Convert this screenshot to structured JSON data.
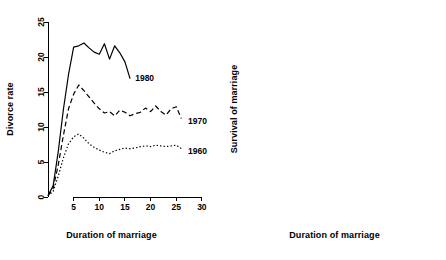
{
  "figure": {
    "panels": [
      {
        "id": "divorce-rate-panel",
        "xlabel": "Duration of marriage",
        "ylabel": "Divorce rate"
      },
      {
        "id": "survival-panel",
        "xlabel": "Duration of marriage",
        "ylabel": "Survival of marriage"
      }
    ]
  },
  "chart_data": [
    {
      "type": "line",
      "title": "",
      "xlabel": "Duration of marriage",
      "ylabel": "Divorce rate",
      "xlim": [
        0,
        31
      ],
      "ylim": [
        0,
        25
      ],
      "xticks": [
        5,
        10,
        15,
        20,
        25,
        30
      ],
      "yticks": [
        0,
        5,
        10,
        15,
        20,
        25
      ],
      "grid": false,
      "legend": "inline-right-of-curves",
      "series": [
        {
          "name": "1980",
          "style": "solid",
          "label_x": 17.0,
          "label_y": 17.0,
          "x": [
            0,
            1,
            2,
            3,
            4,
            5,
            6,
            7,
            8,
            9,
            10,
            11,
            12,
            13,
            14,
            15,
            16
          ],
          "y": [
            0.2,
            1.6,
            6.5,
            12.5,
            17.5,
            21.4,
            21.6,
            22.0,
            21.3,
            20.7,
            20.4,
            21.9,
            19.7,
            21.6,
            20.6,
            19.3,
            16.9
          ]
        },
        {
          "name": "1970",
          "style": "dashed",
          "label_x": 27.3,
          "label_y": 10.9,
          "x": [
            0,
            1,
            2,
            3,
            4,
            5,
            6,
            7,
            8,
            9,
            10,
            11,
            12,
            13,
            14,
            15,
            16,
            17,
            18,
            19,
            20,
            21,
            22,
            23,
            24,
            25,
            26
          ],
          "y": [
            0.2,
            1.2,
            4.6,
            8.8,
            12.6,
            14.7,
            16.0,
            15.2,
            14.3,
            13.4,
            12.6,
            12.0,
            12.2,
            11.6,
            12.4,
            12.1,
            11.6,
            11.9,
            12.1,
            12.7,
            12.2,
            13.0,
            12.2,
            11.7,
            12.6,
            12.9,
            11.2
          ]
        },
        {
          "name": "1960",
          "style": "dotted",
          "label_x": 27.3,
          "label_y": 6.6,
          "x": [
            0,
            1,
            2,
            3,
            4,
            5,
            6,
            7,
            8,
            9,
            10,
            11,
            12,
            13,
            14,
            15,
            16,
            17,
            18,
            19,
            20,
            21,
            22,
            23,
            24,
            25,
            26
          ],
          "y": [
            0.1,
            0.8,
            3.0,
            5.6,
            7.6,
            8.6,
            9.0,
            8.4,
            7.6,
            7.1,
            6.7,
            6.4,
            6.2,
            6.6,
            6.8,
            7.0,
            6.9,
            7.0,
            7.2,
            7.3,
            7.2,
            7.4,
            7.3,
            7.2,
            7.3,
            7.4,
            6.9
          ]
        }
      ]
    },
    {
      "type": "line",
      "title": "",
      "xlabel": "Duration of marriage",
      "ylabel": "Survival of marriage",
      "xlim": [
        0,
        27
      ],
      "ylim": [
        0.5,
        1.0
      ],
      "xticks": [
        5,
        10,
        15,
        20,
        25
      ],
      "yticks": [
        0.5,
        0.6,
        0.7,
        0.8,
        0.9,
        1.0
      ],
      "grid": false,
      "legend": "none",
      "series": [
        {
          "name": "1980",
          "style": "solid",
          "x": [
            0,
            1,
            2,
            3,
            4,
            5,
            6,
            7,
            8,
            9,
            10,
            11,
            12,
            13,
            14,
            15,
            16
          ],
          "y": [
            1.0,
            1.0,
            0.999,
            0.996,
            0.99,
            0.981,
            0.969,
            0.955,
            0.94,
            0.923,
            0.905,
            0.886,
            0.866,
            0.845,
            0.823,
            0.8,
            0.762
          ]
        },
        {
          "name": "1970",
          "style": "dashed",
          "x": [
            0,
            1,
            2,
            3,
            4,
            5,
            6,
            7,
            8,
            9,
            10,
            11,
            12,
            13,
            14,
            15,
            16,
            17,
            18,
            19,
            20,
            21,
            22,
            23,
            24,
            25,
            26
          ],
          "y": [
            1.0,
            1.0,
            0.999,
            0.997,
            0.993,
            0.987,
            0.979,
            0.97,
            0.96,
            0.949,
            0.937,
            0.925,
            0.913,
            0.9,
            0.887,
            0.874,
            0.861,
            0.848,
            0.835,
            0.822,
            0.81,
            0.797,
            0.785,
            0.773,
            0.762,
            0.752,
            0.748
          ]
        },
        {
          "name": "1960",
          "style": "dotted",
          "x": [
            0,
            1,
            2,
            3,
            4,
            5,
            6,
            7,
            8,
            9,
            10,
            11,
            12,
            13,
            14,
            15,
            16,
            17,
            18,
            19,
            20,
            21,
            22,
            23,
            24,
            25,
            26
          ],
          "y": [
            1.0,
            1.0,
            0.999,
            0.998,
            0.996,
            0.993,
            0.989,
            0.985,
            0.98,
            0.974,
            0.968,
            0.962,
            0.955,
            0.948,
            0.941,
            0.934,
            0.927,
            0.92,
            0.913,
            0.905,
            0.897,
            0.889,
            0.881,
            0.872,
            0.863,
            0.854,
            0.845
          ]
        }
      ]
    }
  ]
}
